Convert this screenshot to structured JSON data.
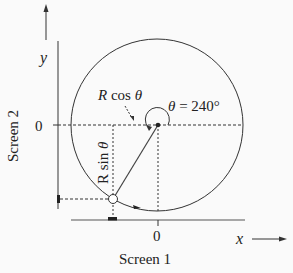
{
  "diagram": {
    "labels": {
      "y_axis": "y",
      "x_axis": "x",
      "screen2": "Screen 2",
      "screen1": "Screen 1",
      "zero_y": "0",
      "zero_x": "0",
      "rcos": "R cos θ",
      "rsin": "R sin θ",
      "theta": "θ = 240°"
    },
    "geometry": {
      "center": [
        157,
        125
      ],
      "radius": 86,
      "angle_deg": 240
    },
    "colors": {
      "line": "#333333",
      "background": "#fafafa"
    }
  }
}
